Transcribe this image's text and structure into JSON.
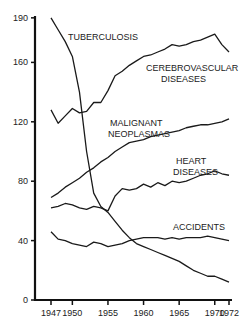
{
  "chart_data": {
    "type": "line",
    "title": "",
    "xlabel": "",
    "ylabel": "",
    "ylim": [
      0,
      190
    ],
    "xlim": [
      1947,
      1972
    ],
    "grid": false,
    "legend_position": "inline labels",
    "y_ticks": [
      "0",
      "40",
      "80",
      "120",
      "160",
      "190"
    ],
    "x_ticks": [
      "1947",
      "1950",
      "1955",
      "1960",
      "1965",
      "1970",
      "1972"
    ],
    "x": [
      1947,
      1948,
      1949,
      1950,
      1951,
      1952,
      1953,
      1954,
      1955,
      1956,
      1957,
      1958,
      1959,
      1960,
      1961,
      1962,
      1963,
      1964,
      1965,
      1966,
      1967,
      1968,
      1969,
      1970,
      1971,
      1972
    ],
    "series": [
      {
        "name": "Tuberculosis",
        "label": "TUBERCULOSIS",
        "values": [
          190,
          182,
          174,
          164,
          140,
          100,
          72,
          63,
          59,
          53,
          47,
          42,
          38,
          36,
          34,
          32,
          30,
          28,
          26,
          23,
          20,
          18,
          16,
          16,
          14,
          12
        ]
      },
      {
        "name": "Cerebrovascular Diseases",
        "label": "CEREBROVASCULAR DISEASES",
        "values": [
          128,
          119,
          124,
          129,
          126,
          127,
          133,
          133,
          141,
          151,
          154,
          158,
          161,
          164,
          165,
          167,
          169,
          172,
          171,
          172,
          174,
          175,
          177,
          179,
          172,
          167
        ]
      },
      {
        "name": "Malignant Neoplasmas",
        "label": "MALIGNANT NEOPLASMAS",
        "values": [
          69,
          72,
          76,
          79,
          82,
          86,
          89,
          93,
          96,
          100,
          103,
          106,
          107,
          108,
          110,
          111,
          112,
          113,
          114,
          116,
          117,
          118,
          118,
          119,
          120,
          122
        ]
      },
      {
        "name": "Heart Diseases",
        "label": "HEART DISEASES",
        "values": [
          62,
          63,
          65,
          64,
          62,
          61,
          63,
          62,
          60,
          70,
          75,
          74,
          75,
          78,
          76,
          79,
          77,
          80,
          79,
          80,
          82,
          84,
          85,
          87,
          85,
          84
        ]
      },
      {
        "name": "Accidents",
        "label": "ACCIDENTS",
        "values": [
          46,
          41,
          40,
          38,
          37,
          36,
          39,
          38,
          36,
          37,
          38,
          40,
          41,
          42,
          42,
          42,
          41,
          42,
          41,
          42,
          42,
          42,
          43,
          42,
          41,
          40
        ]
      }
    ]
  },
  "labels": {
    "tuberculosis": "TUBERCULOSIS",
    "cerebro_line1": "CEREBROVASCULAR",
    "cerebro_line2": "DISEASES",
    "malignant_line1": "MALIGNANT",
    "malignant_line2": "NEOPLASMAS",
    "heart_line1": "HEART",
    "heart_line2": "DISEASES",
    "accidents": "ACCIDENTS"
  },
  "axis": {
    "y_ticks": [
      "0",
      "40",
      "80",
      "120",
      "160",
      "190"
    ],
    "x_ticks": [
      "1947",
      "1950",
      "1955",
      "1960",
      "1965",
      "1970",
      "1972"
    ]
  }
}
